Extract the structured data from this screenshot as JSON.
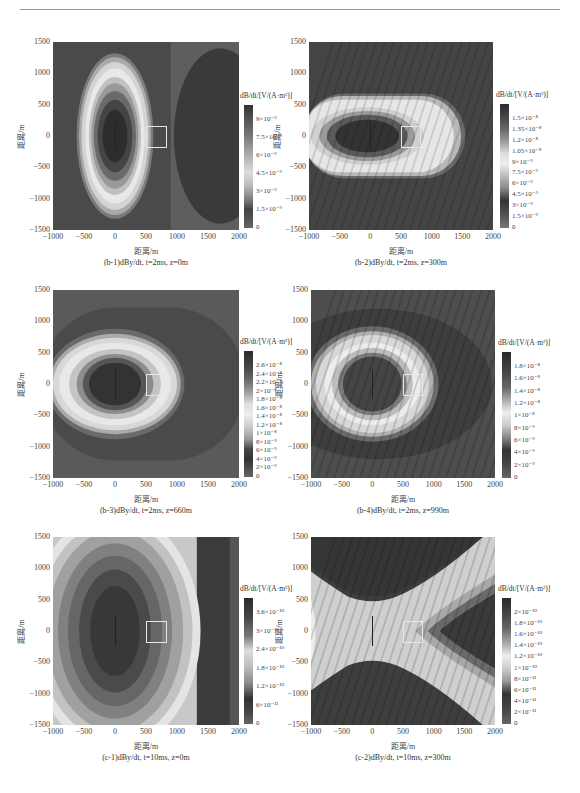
{
  "page": {
    "header_rule": true
  },
  "common": {
    "xlabel": "距离/m",
    "ylabel": "距离/m",
    "xticks": [
      "−1000",
      "−500",
      "0",
      "500",
      "1000",
      "1500",
      "2000"
    ],
    "yticks": [
      "1500",
      "1000",
      "500",
      "0",
      "−500",
      "−1000",
      "−1500"
    ],
    "colorbar_title": "dB/dt/[V/(A·m²)]"
  },
  "panels": [
    {
      "id": "b-1",
      "caption": "(b-1)dBy/dt, t=2ms, z=0m",
      "colorbar_labels": [
        "9×10⁻⁹",
        "7.5×10⁻⁹",
        "6×10⁻⁹",
        "4.5×10⁻⁹",
        "3×10⁻⁹",
        "1.5×10⁻⁹",
        "0"
      ]
    },
    {
      "id": "b-2",
      "caption": "(b-2)dBy/dt, t=2ms, z=300m",
      "colorbar_labels": [
        "1.5×10⁻⁸",
        "1.35×10⁻⁸",
        "1.2×10⁻⁸",
        "1.05×10⁻⁸",
        "9×10⁻⁹",
        "7.5×10⁻⁹",
        "6×10⁻⁹",
        "4.5×10⁻⁹",
        "3×10⁻⁹",
        "1.5×10⁻⁹",
        "0"
      ]
    },
    {
      "id": "b-3",
      "caption": "(b-3)dBy/dt, t=2ms, z=660m",
      "colorbar_labels": [
        "2.6×10⁻⁸",
        "2.4×10⁻⁸",
        "2.2×10⁻⁸",
        "2×10⁻⁸",
        "1.8×10⁻⁸",
        "1.6×10⁻⁸",
        "1.4×10⁻⁸",
        "1.2×10⁻⁸",
        "1×10⁻⁸",
        "8×10⁻⁹",
        "6×10⁻⁹",
        "4×10⁻⁹",
        "2×10⁻⁹",
        "0"
      ]
    },
    {
      "id": "b-4",
      "caption": "(b-4)dBy/dt, t=2ms, z=990m",
      "colorbar_labels": [
        "1.8×10⁻⁸",
        "1.6×10⁻⁸",
        "1.4×10⁻⁸",
        "1.2×10⁻⁸",
        "1×10⁻⁸",
        "8×10⁻⁹",
        "6×10⁻⁹",
        "4×10⁻⁹",
        "2×10⁻⁹",
        "0"
      ]
    },
    {
      "id": "c-1",
      "caption": "(c-1)dBy/dt, t=10ms, z=0m",
      "colorbar_labels": [
        "3.6×10⁻¹⁰",
        "3×10⁻¹⁰",
        "2.4×10⁻¹⁰",
        "1.8×10⁻¹⁰",
        "1.2×10⁻¹⁰",
        "6×10⁻¹¹",
        "0"
      ]
    },
    {
      "id": "c-2",
      "caption": "(c-2)dBy/dt, t=10ms, z=300m",
      "colorbar_labels": [
        "2×10⁻¹⁰",
        "1.8×10⁻¹⁰",
        "1.6×10⁻¹⁰",
        "1.4×10⁻¹⁰",
        "1.2×10⁻¹⁰",
        "1×10⁻¹⁰",
        "8×10⁻¹¹",
        "6×10⁻¹¹",
        "4×10⁻¹¹",
        "2×10⁻¹¹",
        "0"
      ]
    }
  ],
  "chart_data": [
    {
      "type": "heatmap",
      "title": "(b-1)dBy/dt, t=2ms, z=0m",
      "xlabel": "距离/m",
      "ylabel": "距离/m",
      "xlim": [
        -1000,
        2000
      ],
      "ylim": [
        -1500,
        1500
      ],
      "x_ticks": [
        -1000,
        -500,
        0,
        500,
        1000,
        1500,
        2000
      ],
      "y_ticks": [
        -1500,
        -1000,
        -500,
        0,
        500,
        1000,
        1500
      ],
      "colorbar_label": "dB/dt/[V/(A·m²)]",
      "colorbar_ticks": [
        0,
        1.5e-09,
        3e-09,
        4.5e-09,
        6e-09,
        7.5e-09,
        9e-09
      ],
      "description": "Vertically elongated ellipse centred at (0,0); dark core, bright ring ~±500 m in x, ±1300 m in y; dark region right of x≈900"
    },
    {
      "type": "heatmap",
      "title": "(b-2)dBy/dt, t=2ms, z=300m",
      "xlabel": "距离/m",
      "ylabel": "距离/m",
      "xlim": [
        -1000,
        2000
      ],
      "ylim": [
        -1500,
        1500
      ],
      "x_ticks": [
        -1000,
        -500,
        0,
        500,
        1000,
        1500,
        2000
      ],
      "y_ticks": [
        -1500,
        -1000,
        -500,
        0,
        500,
        1000,
        1500
      ],
      "colorbar_label": "dB/dt/[V/(A·m²)]",
      "colorbar_ticks": [
        0,
        1.5e-09,
        3e-09,
        4.5e-09,
        6e-09,
        7.5e-09,
        9e-09,
        1.05e-08,
        1.2e-08,
        1.35e-08,
        1.5e-08
      ],
      "description": "Horizontally elongated stadium shape from x≈-1000 to 1450, y ±650; dark core"
    },
    {
      "type": "heatmap",
      "title": "(b-3)dBy/dt, t=2ms, z=660m",
      "xlabel": "距离/m",
      "ylabel": "距离/m",
      "xlim": [
        -1000,
        2000
      ],
      "ylim": [
        -1500,
        1500
      ],
      "x_ticks": [
        -1000,
        -500,
        0,
        500,
        1000,
        1500,
        2000
      ],
      "y_ticks": [
        -1500,
        -1000,
        -500,
        0,
        500,
        1000,
        1500
      ],
      "colorbar_label": "dB/dt/[V/(A·m²)]",
      "colorbar_ticks": [
        0,
        2e-09,
        4e-09,
        6e-09,
        8e-09,
        1e-08,
        1.2e-08,
        1.4e-08,
        1.6e-08,
        1.8e-08,
        2e-08,
        2.2e-08,
        2.4e-08,
        2.6e-08
      ],
      "description": "Ring ellipse centred at (0,0), radius ~1000 m x, ~700 m y; dark core radius ~500 m"
    },
    {
      "type": "heatmap",
      "title": "(b-4)dBy/dt, t=2ms, z=990m",
      "xlabel": "距离/m",
      "ylabel": "距离/m",
      "xlim": [
        -1000,
        2000
      ],
      "ylim": [
        -1500,
        1500
      ],
      "x_ticks": [
        -1000,
        -500,
        0,
        500,
        1000,
        1500,
        2000
      ],
      "y_ticks": [
        -1500,
        -1000,
        -500,
        0,
        500,
        1000,
        1500
      ],
      "colorbar_label": "dB/dt/[V/(A·m²)]",
      "colorbar_ticks": [
        0,
        2e-09,
        4e-09,
        6e-09,
        8e-09,
        1e-08,
        1.2e-08,
        1.4e-08,
        1.6e-08,
        1.8e-08
      ],
      "description": "Near-circular ring centred at (0,0), radius ~1000 m; dark core radius ~450 m"
    },
    {
      "type": "heatmap",
      "title": "(c-1)dBy/dt, t=10ms, z=0m",
      "xlabel": "距离/m",
      "ylabel": "距离/m",
      "xlim": [
        -1000,
        2000
      ],
      "ylim": [
        -1500,
        1500
      ],
      "x_ticks": [
        -1000,
        -500,
        0,
        500,
        1000,
        1500,
        2000
      ],
      "y_ticks": [
        -1500,
        -1000,
        -500,
        0,
        500,
        1000,
        1500
      ],
      "colorbar_label": "dB/dt/[V/(A·m²)]",
      "colorbar_ticks": [
        0,
        6e-11,
        1.2e-10,
        1.8e-10,
        2.4e-10,
        3e-10,
        3.6e-10
      ],
      "description": "Large vertical ellipse with concentric contour bands centred at (0,0); dark band at x>1300"
    },
    {
      "type": "heatmap",
      "title": "(c-2)dBy/dt, t=10ms, z=300m",
      "xlabel": "距离/m",
      "ylabel": "距离/m",
      "xlim": [
        -1000,
        2000
      ],
      "ylim": [
        -1500,
        1500
      ],
      "x_ticks": [
        -1000,
        -500,
        0,
        500,
        1000,
        1500,
        2000
      ],
      "y_ticks": [
        -1500,
        -1000,
        -500,
        0,
        500,
        1000,
        1500
      ],
      "colorbar_label": "dB/dt/[V/(A·m²)]",
      "colorbar_ticks": [
        0,
        2e-11,
        4e-11,
        6e-11,
        8e-11,
        1e-10,
        1.2e-10,
        1.4e-10,
        1.6e-10,
        1.8e-10,
        2e-10
      ],
      "description": "X-shaped bright saddle centred at (0,0); dark lobes top, bottom and right (x≈1500)"
    }
  ]
}
